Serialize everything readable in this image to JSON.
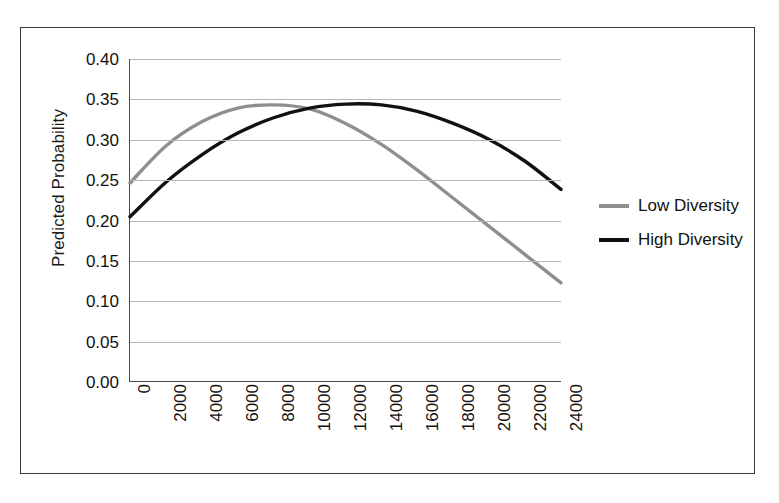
{
  "chart_data": {
    "type": "line",
    "title": "",
    "xlabel": "",
    "ylabel": "Predicted Probability",
    "xlim": [
      0,
      24000
    ],
    "ylim": [
      0.0,
      0.4
    ],
    "grid": true,
    "legend_position": "right",
    "x_tick_labels": [
      "0",
      "2000",
      "4000",
      "6000",
      "8000",
      "10000",
      "12000",
      "14000",
      "16000",
      "18000",
      "20000",
      "22000",
      "24000"
    ],
    "x_ticks": [
      0,
      2000,
      4000,
      6000,
      8000,
      10000,
      12000,
      14000,
      16000,
      18000,
      20000,
      22000,
      24000
    ],
    "y_tick_labels": [
      "0.40",
      "0.35",
      "0.30",
      "0.25",
      "0.20",
      "0.15",
      "0.10",
      "0.05",
      "0.00"
    ],
    "y_ticks": [
      0.4,
      0.35,
      0.3,
      0.25,
      0.2,
      0.15,
      0.1,
      0.05,
      0.0
    ],
    "x": [
      0,
      2000,
      4000,
      6000,
      8000,
      10000,
      12000,
      14000,
      16000,
      18000,
      20000,
      22000,
      24000
    ],
    "series": [
      {
        "name": "Low Diversity",
        "color": "#8f8f8f",
        "values": [
          0.246,
          0.292,
          0.322,
          0.339,
          0.343,
          0.338,
          0.32,
          0.294,
          0.262,
          0.227,
          0.192,
          0.157,
          0.122
        ]
      },
      {
        "name": "High Diversity",
        "color": "#111111",
        "values": [
          0.204,
          0.247,
          0.281,
          0.308,
          0.327,
          0.339,
          0.344,
          0.343,
          0.335,
          0.32,
          0.3,
          0.273,
          0.238
        ]
      }
    ]
  },
  "axes": {
    "y_title": "Predicted Probability"
  },
  "legend": {
    "items": [
      {
        "label": "Low Diversity",
        "color": "#8f8f8f"
      },
      {
        "label": "High Diversity",
        "color": "#111111"
      }
    ]
  }
}
